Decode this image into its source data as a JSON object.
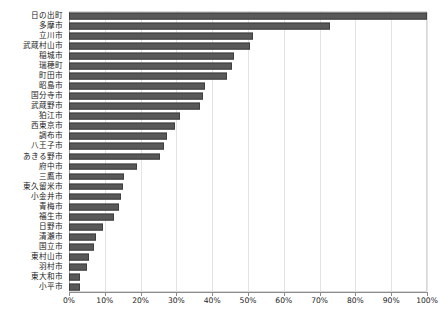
{
  "chart_data": {
    "type": "bar",
    "orientation": "horizontal",
    "title": "",
    "xlabel": "",
    "ylabel": "",
    "xlim": [
      0,
      100
    ],
    "xtick_values": [
      0,
      10,
      20,
      30,
      40,
      50,
      60,
      70,
      80,
      90,
      100
    ],
    "xtick_labels": [
      "0%",
      "10%",
      "20%",
      "30%",
      "40%",
      "50%",
      "60%",
      "70%",
      "80%",
      "90%",
      "100%"
    ],
    "grid": true,
    "legend": "none",
    "bar_color": "#595959",
    "bar_edge_color": "#3f3f3f",
    "gridline_color": "#e3e3e3",
    "axis_color": "#8c8c8c",
    "categories": [
      "日の出町",
      "多摩市",
      "立川市",
      "武蔵村山市",
      "稲城市",
      "瑞穂町",
      "町田市",
      "昭島市",
      "国分寺市",
      "武蔵野市",
      "狛江市",
      "西東京市",
      "調布市",
      "八王子市",
      "あきる野市",
      "府中市",
      "三鷹市",
      "東久留米市",
      "小金井市",
      "青梅市",
      "福生市",
      "日野市",
      "清瀬市",
      "国立市",
      "東村山市",
      "羽村市",
      "東大和市",
      "小平市"
    ],
    "values": [
      100,
      73,
      51.5,
      50.5,
      46,
      45.5,
      44,
      38,
      37.5,
      36.5,
      31,
      29.5,
      27.5,
      26.5,
      25.5,
      19,
      15.5,
      15,
      14.5,
      14,
      12.5,
      9.5,
      7.5,
      7,
      5.5,
      5,
      3,
      3
    ]
  }
}
